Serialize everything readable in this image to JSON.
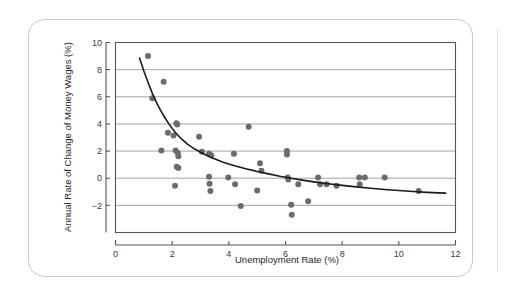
{
  "figure": {
    "card_border_color": "#c9c9c9",
    "background_color": "#ffffff"
  },
  "chart_data": {
    "type": "scatter",
    "title": "",
    "subtitle": "",
    "xlabel": "Unemployment Rate (%)",
    "ylabel": "Annual Rate of Change of Money Wages (%)",
    "xlim": [
      0,
      12
    ],
    "ylim": [
      -4,
      10
    ],
    "xticks": [
      0,
      2,
      4,
      6,
      8,
      10,
      12
    ],
    "yticks": [
      -2,
      0,
      2,
      4,
      6,
      8,
      10
    ],
    "xtick_labels": [
      "0",
      "2",
      "4",
      "6",
      "8",
      "10",
      "12"
    ],
    "ytick_labels": [
      "−2",
      "0",
      "2",
      "4",
      "6",
      "8",
      "10"
    ],
    "grid": "horizontal",
    "grid_color": "#8c8c8c",
    "axis_color": "#555555",
    "legend": "none",
    "marker_color": "#6b6b6b",
    "marker_size_px": 4.2,
    "series": [
      {
        "name": "Observations",
        "type": "scatter",
        "points": [
          [
            1.15,
            9.0
          ],
          [
            1.3,
            5.9
          ],
          [
            1.7,
            7.1
          ],
          [
            1.62,
            2.05
          ],
          [
            1.85,
            3.35
          ],
          [
            2.05,
            3.15
          ],
          [
            2.15,
            4.05
          ],
          [
            2.18,
            3.95
          ],
          [
            2.12,
            2.05
          ],
          [
            2.2,
            1.85
          ],
          [
            2.22,
            1.62
          ],
          [
            2.22,
            0.75
          ],
          [
            2.16,
            0.85
          ],
          [
            2.1,
            -0.55
          ],
          [
            2.95,
            3.05
          ],
          [
            3.05,
            1.95
          ],
          [
            3.3,
            1.8
          ],
          [
            3.38,
            1.7
          ],
          [
            3.3,
            0.1
          ],
          [
            3.32,
            -0.4
          ],
          [
            3.35,
            -0.95
          ],
          [
            3.98,
            0.05
          ],
          [
            4.18,
            1.8
          ],
          [
            4.22,
            -0.45
          ],
          [
            4.42,
            -2.05
          ],
          [
            4.7,
            3.8
          ],
          [
            5.0,
            -0.9
          ],
          [
            5.1,
            1.1
          ],
          [
            5.15,
            0.55
          ],
          [
            6.05,
            2.0
          ],
          [
            6.05,
            1.75
          ],
          [
            6.08,
            0.05
          ],
          [
            6.1,
            -0.1
          ],
          [
            6.2,
            -1.95
          ],
          [
            6.22,
            -2.7
          ],
          [
            6.45,
            -0.45
          ],
          [
            6.8,
            -1.7
          ],
          [
            7.15,
            0.05
          ],
          [
            7.22,
            -0.45
          ],
          [
            7.45,
            -0.45
          ],
          [
            7.8,
            -0.55
          ],
          [
            8.6,
            0.05
          ],
          [
            8.62,
            -0.45
          ],
          [
            8.8,
            0.05
          ],
          [
            9.5,
            0.05
          ],
          [
            10.7,
            -0.95
          ]
        ]
      },
      {
        "name": "Fitted Phillips Curve",
        "type": "line",
        "color": "#1a1a1a",
        "width_px": 1.6,
        "points": [
          [
            0.85,
            8.85
          ],
          [
            1.0,
            7.9
          ],
          [
            1.15,
            7.05
          ],
          [
            1.3,
            6.25
          ],
          [
            1.5,
            5.35
          ],
          [
            1.7,
            4.6
          ],
          [
            1.9,
            3.95
          ],
          [
            2.1,
            3.4
          ],
          [
            2.3,
            2.95
          ],
          [
            2.55,
            2.5
          ],
          [
            2.8,
            2.15
          ],
          [
            3.1,
            1.8
          ],
          [
            3.4,
            1.5
          ],
          [
            3.8,
            1.18
          ],
          [
            4.2,
            0.92
          ],
          [
            4.6,
            0.7
          ],
          [
            5.0,
            0.5
          ],
          [
            5.4,
            0.32
          ],
          [
            5.8,
            0.15
          ],
          [
            6.2,
            0.0
          ],
          [
            6.6,
            -0.14
          ],
          [
            7.0,
            -0.27
          ],
          [
            7.5,
            -0.41
          ],
          [
            8.0,
            -0.53
          ],
          [
            8.5,
            -0.64
          ],
          [
            9.0,
            -0.74
          ],
          [
            9.5,
            -0.83
          ],
          [
            10.0,
            -0.91
          ],
          [
            10.5,
            -0.98
          ],
          [
            11.0,
            -1.04
          ],
          [
            11.4,
            -1.08
          ],
          [
            11.65,
            -1.1
          ]
        ]
      }
    ]
  }
}
